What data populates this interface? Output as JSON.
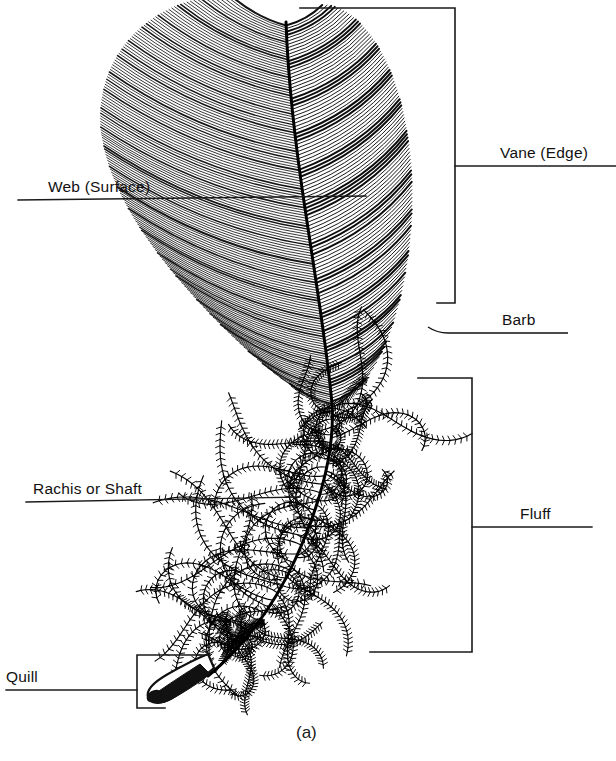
{
  "figure": {
    "caption": "(a)",
    "background_color": "#ffffff",
    "ink_color": "#000000"
  },
  "labels": [
    {
      "id": "vane-edge",
      "text": "Vane (Edge)",
      "annotation_type": "bracket",
      "side": "right"
    },
    {
      "id": "web-surface",
      "text": "Web (Surface)",
      "annotation_type": "leader-line",
      "side": "left"
    },
    {
      "id": "barb",
      "text": "Barb",
      "annotation_type": "leader-line",
      "side": "right"
    },
    {
      "id": "fluff",
      "text": "Fluff",
      "annotation_type": "bracket",
      "side": "right"
    },
    {
      "id": "rachis-or-shaft",
      "text": "Rachis or Shaft",
      "annotation_type": "leader-line",
      "side": "left"
    },
    {
      "id": "quill",
      "text": "Quill",
      "annotation_type": "bracket",
      "side": "left"
    }
  ]
}
